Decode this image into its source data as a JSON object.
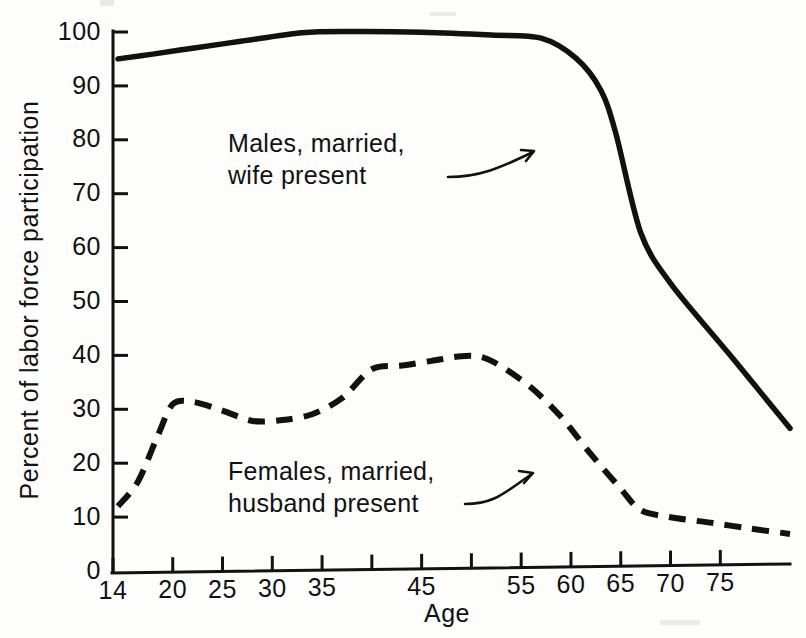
{
  "figure": {
    "name": "labor-force-participation-by-age-chart",
    "background_color": "#fdfdfc",
    "ink_color": "#111111"
  },
  "chart_data": {
    "type": "line",
    "title": "",
    "subtitle": "",
    "xlabel": "Age",
    "ylabel": "Percent of labor force participation",
    "xlim": [
      14,
      82
    ],
    "ylim": [
      0,
      100
    ],
    "grid": false,
    "legend_position": "inline-annotations",
    "x_ticks": [
      14,
      20,
      25,
      30,
      35,
      40,
      45,
      50,
      55,
      60,
      65,
      70,
      75
    ],
    "x_tick_labels": [
      "14",
      "20",
      "25",
      "30",
      "35",
      "",
      "45",
      "",
      "55",
      "60",
      "65",
      "70",
      "75"
    ],
    "y_ticks": [
      0,
      10,
      20,
      30,
      40,
      50,
      60,
      70,
      80,
      90,
      100
    ],
    "y_tick_labels": [
      "0",
      "10",
      "20",
      "30",
      "40",
      "50",
      "60",
      "70",
      "80",
      "90",
      "100"
    ],
    "series": [
      {
        "name": "Males, married, wife present",
        "style": "solid",
        "x": [
          14.5,
          18,
          22,
          27,
          33,
          38,
          45,
          52,
          57,
          60.5,
          63,
          64.5,
          67,
          70,
          76,
          82
        ],
        "y": [
          95.0,
          95.8,
          96.8,
          98.0,
          99.4,
          99.5,
          99.2,
          98.5,
          97.8,
          94.0,
          88.0,
          80.0,
          61.5,
          52.0,
          38.5,
          24.8
        ]
      },
      {
        "name": "Females, married, husband present",
        "style": "dashed",
        "x": [
          14.5,
          16.5,
          18.5,
          20,
          22,
          25,
          28,
          31,
          34,
          37,
          40,
          43,
          46,
          49,
          51,
          53,
          56,
          59,
          62,
          65,
          67,
          70,
          74,
          78,
          82
        ],
        "y": [
          12.0,
          16.5,
          25.0,
          30.8,
          31.2,
          29.5,
          27.5,
          27.6,
          28.6,
          31.5,
          36.8,
          37.4,
          38.2,
          39.0,
          38.8,
          37.0,
          33.0,
          27.5,
          20.5,
          14.0,
          10.0,
          8.6,
          7.5,
          6.3,
          5.2
        ]
      }
    ],
    "annotations": [
      {
        "id": "males-annotation",
        "lines": [
          "Males, married,",
          "wife present"
        ],
        "text_x_px": 228,
        "text_y_px": 150,
        "points_to_series": "Males, married, wife present"
      },
      {
        "id": "females-annotation",
        "lines": [
          "Females, married,",
          "husband present"
        ],
        "text_x_px": 228,
        "text_y_px": 478,
        "points_to_series": "Females, married, husband present"
      }
    ]
  },
  "axes": {
    "x_title": "Age",
    "y_title": "Percent of labor force participation"
  }
}
